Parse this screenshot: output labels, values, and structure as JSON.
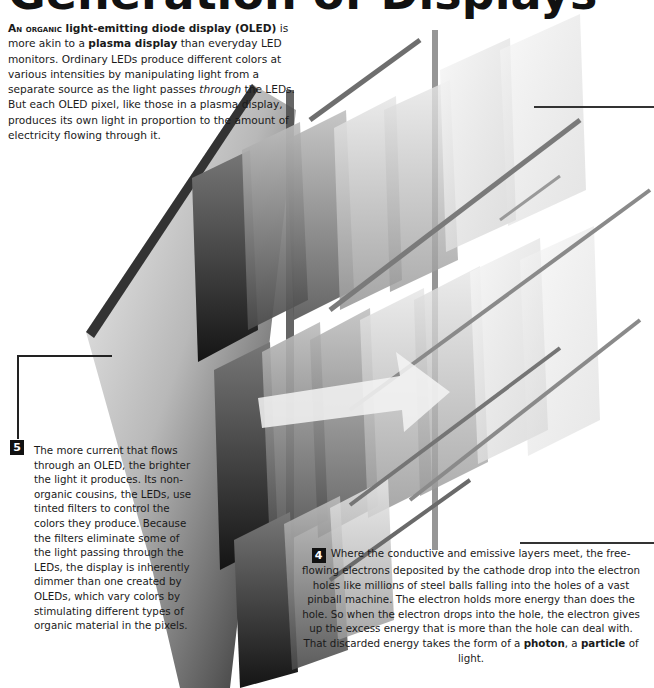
{
  "title": "Generation of Displays",
  "intro": {
    "lead_caps": "An organic",
    "lead_rest": " light-emitting diode display (OLED)",
    "part1": " is more akin to a ",
    "bold1": "plasma display",
    "part2": " than everyday LED monitors. Ordinary LEDs produce different colors at various intensities by manipulating light from a separate source as the light passes ",
    "italic1": "through",
    "part3": " the LEDs. But each OLED pixel, like those in a plasma display, produces its own light in proportion to the amount of electricity flowing through it."
  },
  "callouts": [
    {
      "number": "5",
      "text": "The more current that flows through an OLED, the brighter the light it produces. Its non-organic cousins, the LEDs, use tinted filters to control the colors they produce. Because the filters eliminate some of the light passing through the LEDs, the display is inherently dimmer than one created by OLEDs, which vary colors by stimulating different types of organic material in the pixels."
    },
    {
      "number": "4",
      "text_a": "Where the conductive and emissive layers meet, the free-flowing electrons deposited by the cathode drop into the electron holes like millions of steel balls falling into the holes of a vast pinball machine. The electron holds more energy than does the hole. So when the electron drops into the hole, the electron gives up the excess energy that is more than the hole can deal with. That discarded energy takes the form of a ",
      "bold_a": "photon",
      "text_b": ", a ",
      "bold_b": "particle",
      "text_c": " of light."
    }
  ],
  "illustration": {
    "subject": "exploded OLED layer stack with light arrow",
    "arrow_color": "#f2f2f2",
    "panel_colors": [
      "#2a2a2a",
      "#6b6b6b",
      "#a8a8a8",
      "#d6d6d6",
      "#ededed"
    ]
  }
}
